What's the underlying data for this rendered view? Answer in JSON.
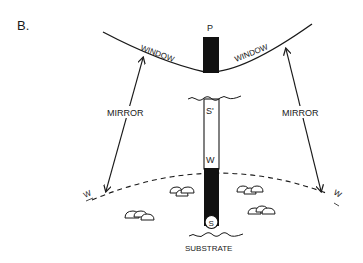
{
  "figure": {
    "panel_label": "B.",
    "labels": {
      "probe": "P",
      "window_left": "WINDOW",
      "window_right": "WINDOW",
      "mirror_left": "MIRROR",
      "mirror_right": "MIRROR",
      "s_prime": "S'",
      "w_column": "W",
      "s_bottom": "S",
      "w_left": "W",
      "w_right": "W",
      "substrate": "SUBSTRATE"
    },
    "colors": {
      "ink": "#1a1a1a",
      "background": "#ffffff"
    }
  }
}
